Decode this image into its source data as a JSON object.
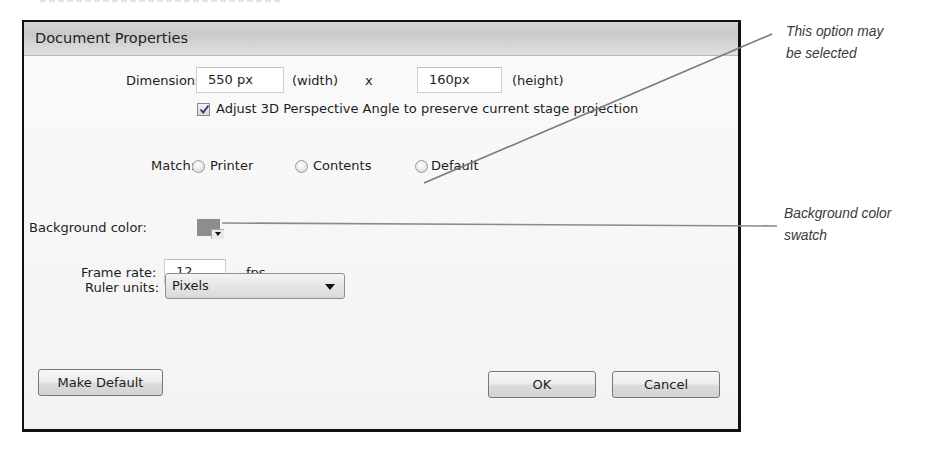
{
  "dialog": {
    "title": "Document Properties",
    "dimensions": {
      "label": "Dimensions:",
      "width_value": "550 px",
      "width_suffix": "(width)",
      "separator": "x",
      "height_value": "160px",
      "height_suffix": "(height)"
    },
    "adjust_3d": {
      "checked": true,
      "label": "Adjust 3D Perspective Angle to preserve current stage projection"
    },
    "match": {
      "label": "Match:",
      "options": [
        {
          "label": "Printer",
          "selected": false
        },
        {
          "label": "Contents",
          "selected": false
        },
        {
          "label": "Default",
          "selected": false
        }
      ]
    },
    "background_color": {
      "label": "Background color:",
      "swatch_color": "#8d8d8d"
    },
    "frame_rate": {
      "label": "Frame rate:",
      "value": "12",
      "unit": "fps"
    },
    "ruler_units": {
      "label": "Ruler units:",
      "selected": "Pixels"
    },
    "buttons": {
      "make_default": "Make Default",
      "ok": "OK",
      "cancel": "Cancel"
    }
  },
  "callouts": [
    {
      "text_line1": "This option may",
      "text_line2": "be selected"
    },
    {
      "text_line1": "Background color",
      "text_line2": "swatch"
    }
  ]
}
